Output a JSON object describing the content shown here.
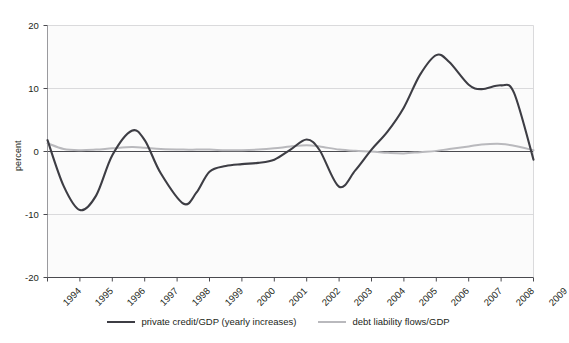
{
  "chart_data": {
    "type": "line",
    "title": "",
    "xlabel": "",
    "ylabel": "percent",
    "ylim": [
      -20,
      20
    ],
    "xlim": [
      1994,
      2009
    ],
    "yticks": [
      "20",
      "10",
      "0",
      "-10",
      "-20"
    ],
    "ytick_values": [
      20,
      10,
      0,
      -10,
      -20
    ],
    "xticks": [
      "1994",
      "1995",
      "1996",
      "1997",
      "1998",
      "1999",
      "2000",
      "2001",
      "2002",
      "2003",
      "2004",
      "2005",
      "2006",
      "2007",
      "2008",
      "2009"
    ],
    "grid": "horizontal",
    "legend_position": "bottom-center",
    "x": [
      1994,
      1994.5,
      1995,
      1995.5,
      1996,
      1996.6,
      1997,
      1997.5,
      1998.2,
      1998.6,
      1999,
      1999.5,
      2000,
      2000.5,
      2001,
      2001.5,
      2002,
      2002.4,
      2003,
      2003.5,
      2004,
      2004.5,
      2005,
      2005.5,
      2006,
      2006.4,
      2007,
      2007.4,
      2008,
      2008.4,
      2009
    ],
    "series": [
      {
        "name": "private credit/GDP (yearly increases)",
        "color": "#3d3d44",
        "values": [
          1.8,
          -5.5,
          -9.3,
          -7.0,
          -0.6,
          3.3,
          1.8,
          -3.5,
          -8.3,
          -6.5,
          -3.2,
          -2.3,
          -2.0,
          -1.8,
          -1.3,
          0.3,
          1.9,
          0.2,
          -5.6,
          -3.0,
          0.3,
          3.2,
          7.0,
          12.2,
          15.3,
          14.2,
          10.6,
          9.9,
          10.5,
          9.3,
          -1.3
        ]
      },
      {
        "name": "debt liability flows/GDP",
        "color": "#b9b9bd",
        "values": [
          1.3,
          0.4,
          0.2,
          0.3,
          0.5,
          0.7,
          0.6,
          0.4,
          0.3,
          0.3,
          0.3,
          0.2,
          0.2,
          0.3,
          0.5,
          0.8,
          1.0,
          0.8,
          0.3,
          0.1,
          0.0,
          -0.2,
          -0.3,
          -0.1,
          0.1,
          0.4,
          0.8,
          1.1,
          1.2,
          0.9,
          0.2
        ]
      }
    ]
  },
  "legend": {
    "entries": [
      {
        "label": "private credit/GDP (yearly increases)",
        "color": "#3d3d44"
      },
      {
        "label": "debt liability flows/GDP",
        "color": "#b9b9bd"
      }
    ]
  },
  "axis": {
    "y_title": "percent"
  }
}
